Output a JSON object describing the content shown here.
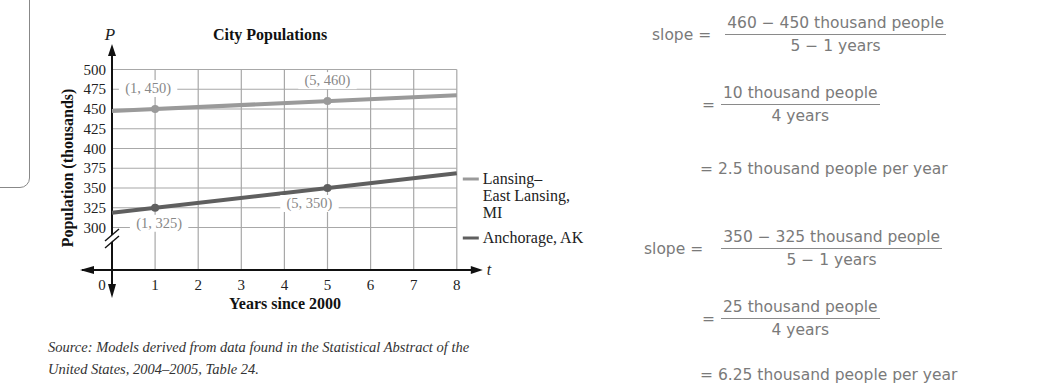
{
  "chart_data": {
    "type": "line",
    "title": "City Populations",
    "xlabel": "Years since 2000",
    "ylabel": "Population (thousands)",
    "x_axis_var": "t",
    "y_axis_var": "P",
    "x_ticks": [
      "0",
      "1",
      "2",
      "3",
      "4",
      "5",
      "6",
      "7",
      "8"
    ],
    "y_ticks": [
      "300",
      "325",
      "350",
      "375",
      "400",
      "425",
      "450",
      "475",
      "500"
    ],
    "xlim": [
      0,
      8
    ],
    "ylim": [
      300,
      500
    ],
    "axis_break": true,
    "grid": true,
    "legend_position": "right",
    "series": [
      {
        "name": "Lansing–East Lansing, MI",
        "legend_lines": [
          "Lansing–",
          "East Lansing,",
          "MI"
        ],
        "color": "#9a9a9a",
        "x": [
          0,
          8
        ],
        "y": [
          447.5,
          467.5
        ],
        "points": [
          {
            "x": 1,
            "y": 450,
            "label": "(1, 450)"
          },
          {
            "x": 5,
            "y": 460,
            "label": "(5, 460)"
          }
        ]
      },
      {
        "name": "Anchorage, AK",
        "legend_lines": [
          "Anchorage, AK"
        ],
        "color": "#5f5f5f",
        "x": [
          0,
          8
        ],
        "y": [
          318.75,
          368.75
        ],
        "points": [
          {
            "x": 1,
            "y": 325,
            "label": "(1, 325)"
          },
          {
            "x": 5,
            "y": 350,
            "label": "(5, 350)"
          }
        ]
      }
    ],
    "origin_label": "0"
  },
  "source": {
    "line1": "Source: Models derived from data found in the Statistical Abstract of the",
    "line2": "United States, 2004–2005, Table 24."
  },
  "work": {
    "lansing": {
      "slope_label": "slope =",
      "step1_num": "460 − 450 thousand people",
      "step1_den": "5 − 1 years",
      "step2_num": "10 thousand people",
      "step2_den": "4 years",
      "step3": "= 2.5 thousand people per year",
      "eq": "="
    },
    "anchorage": {
      "slope_label": "slope =",
      "step1_num": "350 − 325 thousand people",
      "step1_den": "5 − 1 years",
      "step2_num": "25 thousand people",
      "step2_den": "4 years",
      "step3": "= 6.25 thousand people per year",
      "eq": "="
    }
  }
}
